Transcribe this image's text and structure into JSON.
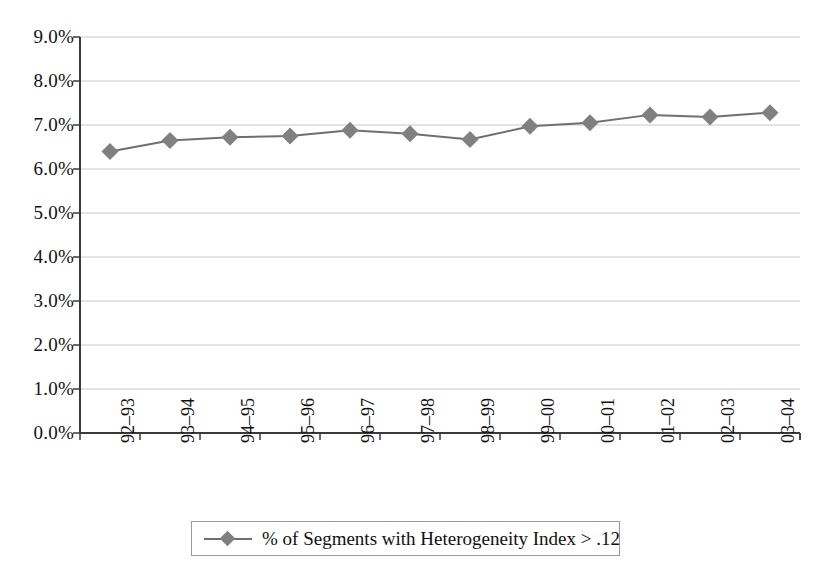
{
  "chart_data": {
    "type": "line",
    "title": "",
    "subtitle": "",
    "xlabel": "",
    "ylabel": "",
    "categories": [
      "92–93",
      "93–94",
      "94–95",
      "95–96",
      "96–97",
      "97–98",
      "98–99",
      "99–00",
      "00–01",
      "01–02",
      "02–03",
      "03–04"
    ],
    "series": [
      {
        "name": "% of Segments with Heterogeneity Index > .12",
        "values": [
          6.4,
          6.65,
          6.72,
          6.75,
          6.88,
          6.8,
          6.67,
          6.97,
          7.05,
          7.23,
          7.18,
          7.28
        ],
        "color": "#808080",
        "marker": "diamond"
      }
    ],
    "ylim": [
      0.0,
      9.0
    ],
    "ytick_step": 1.0,
    "ytick_labels": [
      "9.0%",
      "8.0%",
      "7.0%",
      "6.0%",
      "5.0%",
      "4.0%",
      "3.0%",
      "2.0%",
      "1.0%",
      "0.0%"
    ],
    "ytick_values": [
      9.0,
      8.0,
      7.0,
      6.0,
      5.0,
      4.0,
      3.0,
      2.0,
      1.0,
      0.0
    ],
    "grid": true,
    "grid_axis": "y",
    "grid_color": "#c8c8c8",
    "axis_color": "#3a3a3a",
    "plot_background": "#ffffff",
    "legend": {
      "position": "bottom",
      "entries": [
        {
          "label": "% of Segments with Heterogeneity Index > .12",
          "marker": "diamond",
          "color": "#808080"
        }
      ]
    }
  },
  "legend": {
    "entry_label": "% of Segments with Heterogeneity Index > .12"
  }
}
